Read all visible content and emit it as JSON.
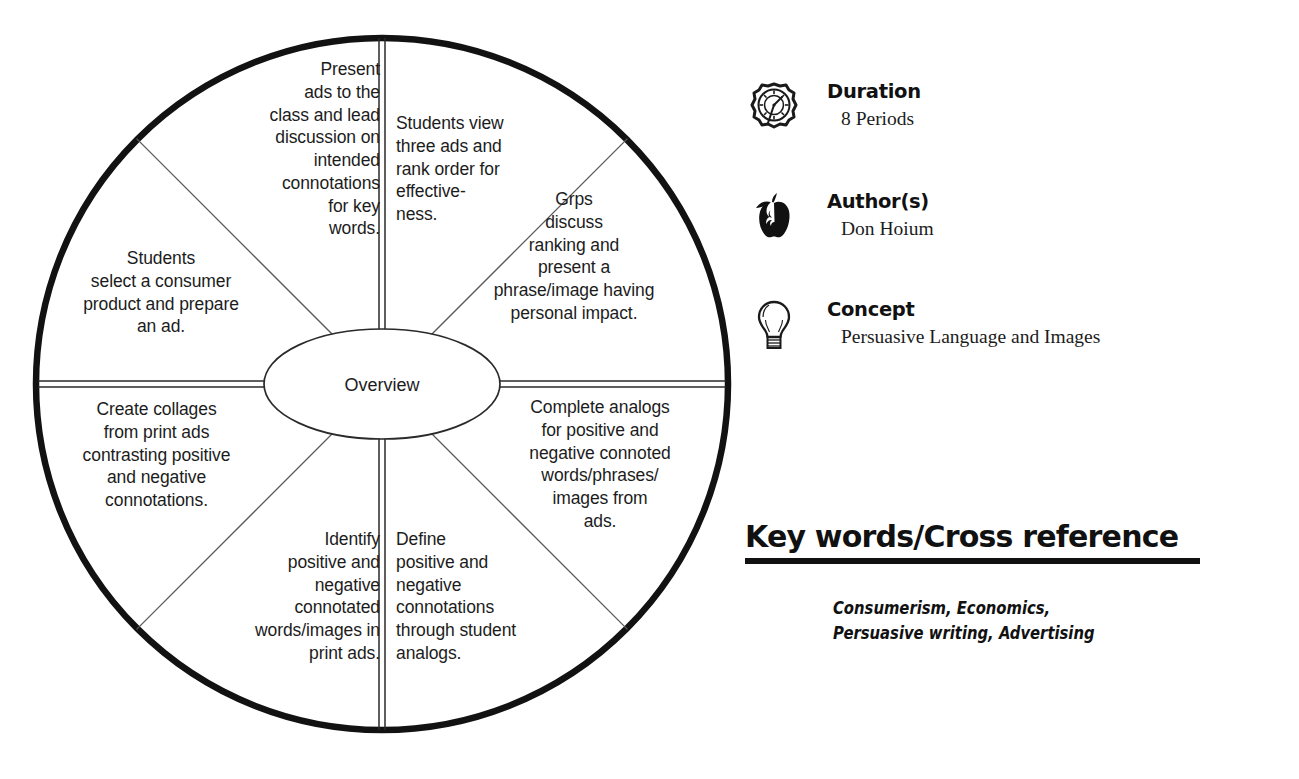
{
  "wheel": {
    "center_label": "Overview",
    "segments": [
      {
        "id": "present-ads",
        "text": "Present\nads to the\nclass and lead\ndiscussion on\nintended\nconnotations\nfor key\nwords."
      },
      {
        "id": "students-view",
        "text": "Students view\nthree ads and\nrank order for\neffective-\nness."
      },
      {
        "id": "grps-discuss",
        "text": "Grps\ndiscuss\nranking and\npresent a\nphrase/image having\npersonal impact."
      },
      {
        "id": "complete-analogs",
        "text": "Complete analogs\nfor positive and\nnegative connoted\nwords/phrases/\nimages from\nads."
      },
      {
        "id": "define-connotations",
        "text": "Define\npositive and\nnegative\nconnotations\nthrough student\nanalogs."
      },
      {
        "id": "identify-connotated",
        "text": "Identify\npositive and\nnegative\nconnotated\nwords/images in\nprint ads."
      },
      {
        "id": "create-collages",
        "text": "Create collages\nfrom print ads\ncontrasting positive\nand negative\nconnotations."
      },
      {
        "id": "select-product",
        "text": "Students\nselect a consumer\nproduct and prepare\nan ad."
      }
    ]
  },
  "info": {
    "duration": {
      "icon": "stopwatch-icon",
      "label": "Duration",
      "value": "8 Periods"
    },
    "author": {
      "icon": "apple-icon",
      "label": "Author(s)",
      "value": "Don Hoium"
    },
    "concept": {
      "icon": "lightbulb-icon",
      "label": "Concept",
      "value": "Persuasive Language and Images"
    },
    "keywords": {
      "heading": "Key words/Cross reference",
      "value": "Consumerism, Economics, Persuasive writing, Advertising"
    }
  },
  "colors": {
    "ink": "#111111",
    "text": "#1c1c1c",
    "hairline": "#555555",
    "background": "#ffffff"
  }
}
